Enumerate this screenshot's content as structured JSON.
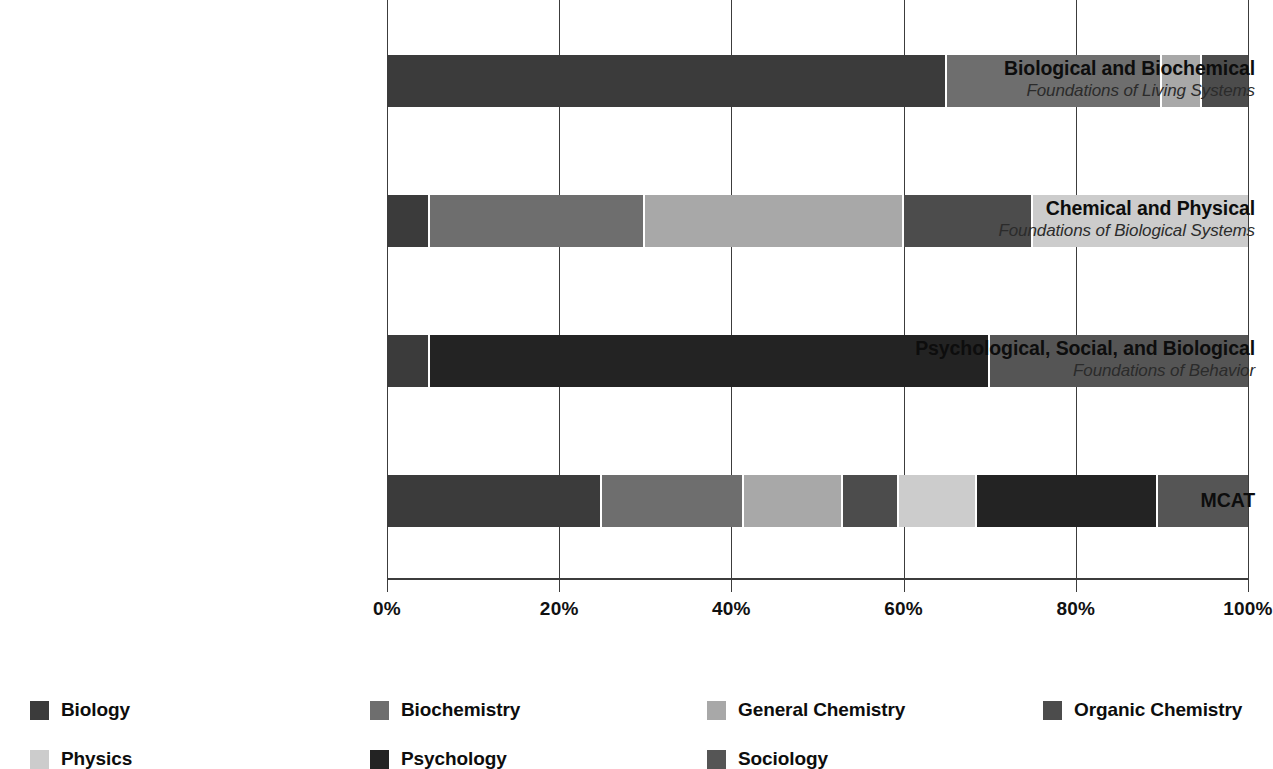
{
  "chart_data": {
    "type": "bar",
    "subtype": "stacked-horizontal-100pct",
    "title": "",
    "xlabel": "",
    "ylabel": "",
    "xlim": [
      0,
      100
    ],
    "xticks": [
      "0%",
      "20%",
      "40%",
      "60%",
      "80%",
      "100%"
    ],
    "xtick_values": [
      0,
      20,
      40,
      60,
      80,
      100
    ],
    "grid": true,
    "legend_position": "bottom",
    "categories": [
      {
        "main": "Biological and Biochemical",
        "sub": "Foundations of Living Systems"
      },
      {
        "main": "Chemical and Physical",
        "sub": "Foundations of Biological Systems"
      },
      {
        "main": "Psychological, Social, and Biological",
        "sub": "Foundations of Behavior"
      },
      {
        "main": "MCAT",
        "sub": ""
      }
    ],
    "series": [
      {
        "name": "Biology",
        "color": "#3b3b3b",
        "values": [
          65,
          5,
          5,
          25
        ]
      },
      {
        "name": "Biochemistry",
        "color": "#6e6e6e",
        "values": [
          25,
          25,
          0,
          16.5
        ]
      },
      {
        "name": "General Chemistry",
        "color": "#a8a8a8",
        "values": [
          4.7,
          30,
          0,
          11.5
        ]
      },
      {
        "name": "Organic Chemistry",
        "color": "#4c4c4c",
        "values": [
          5.3,
          15,
          0,
          6.5
        ]
      },
      {
        "name": "Physics",
        "color": "#cccccc",
        "values": [
          0,
          25,
          0,
          9
        ]
      },
      {
        "name": "Psychology",
        "color": "#232323",
        "values": [
          0,
          0,
          65,
          21
        ]
      },
      {
        "name": "Sociology",
        "color": "#555555",
        "values": [
          0,
          0,
          30,
          10.5
        ]
      }
    ]
  },
  "legend": {
    "items": [
      {
        "label": "Biology",
        "color": "#3b3b3b"
      },
      {
        "label": "Biochemistry",
        "color": "#6e6e6e"
      },
      {
        "label": "General Chemistry",
        "color": "#a8a8a8"
      },
      {
        "label": "Organic Chemistry",
        "color": "#4c4c4c"
      },
      {
        "label": "Physics",
        "color": "#cccccc"
      },
      {
        "label": "Psychology",
        "color": "#232323"
      },
      {
        "label": "Sociology",
        "color": "#555555"
      }
    ]
  }
}
